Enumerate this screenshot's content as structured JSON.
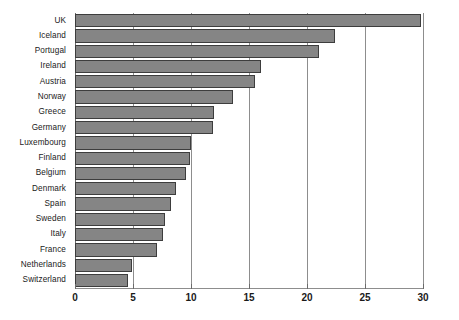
{
  "chart_data": {
    "type": "bar",
    "orientation": "horizontal",
    "title": "",
    "xlabel": "",
    "ylabel": "",
    "xlim": [
      0,
      30
    ],
    "xticks": [
      0,
      5,
      10,
      15,
      20,
      25,
      30
    ],
    "grid": true,
    "legend": "none",
    "bar_color": "#858585",
    "bar_edge_color": "#3d3d3d",
    "gridline_color": "#8d8d8d",
    "categories": [
      "UK",
      "Iceland",
      "Portugal",
      "Ireland",
      "Austria",
      "Norway",
      "Greece",
      "Germany",
      "Luxembourg",
      "Finland",
      "Belgium",
      "Denmark",
      "Spain",
      "Sweden",
      "Italy",
      "France",
      "Netherlands",
      "Switzerland"
    ],
    "values": [
      29.8,
      22.4,
      21.0,
      16.0,
      15.5,
      13.6,
      12.0,
      11.9,
      10.0,
      9.9,
      9.6,
      8.7,
      8.3,
      7.8,
      7.6,
      7.1,
      4.9,
      4.6
    ]
  }
}
